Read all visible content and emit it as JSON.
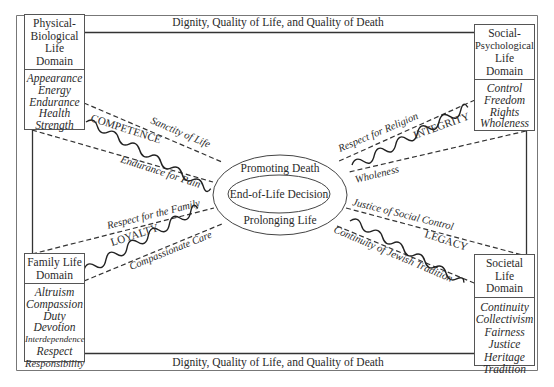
{
  "title_top": "Dignity, Quality of Life, and Quality of Death",
  "title_bottom": "Dignity, Quality of Life, and Quality of Death",
  "center": {
    "outer_top": "Promoting Death",
    "inner": "End-of-Life Decision",
    "outer_bottom": "Prolonging Life"
  },
  "domains": {
    "physical": {
      "head": [
        "Physical-",
        "Biological",
        "Life Domain"
      ],
      "items": [
        "Appearance",
        "Energy",
        "Endurance",
        "Health",
        "Strength"
      ]
    },
    "social": {
      "head": [
        "Social-",
        "Psychological",
        "Life Domain"
      ],
      "items": [
        "Control",
        "Freedom",
        "Rights",
        "Wholeness"
      ]
    },
    "family": {
      "head": [
        "Family Life",
        "Domain"
      ],
      "items": [
        "Altruism",
        "Compassion",
        "Duty",
        "Devotion",
        "Interdependence",
        "Respect",
        "Responsibility"
      ]
    },
    "societal": {
      "head": [
        "Societal Life",
        "Domain"
      ],
      "items": [
        "Continuity",
        "Collectivism",
        "Fairness",
        "Justice",
        "Heritage",
        "Tradition"
      ]
    }
  },
  "bands": {
    "competence": {
      "label": "COMPETENCE",
      "upper": "Sanctity of Life",
      "lower": "Endurance for Pain"
    },
    "integrity": {
      "label": "INTEGRITY",
      "upper": "Respect for Religion",
      "lower": "Wholeness"
    },
    "loyalty": {
      "label": "LOYALTY",
      "upper": "Respect for the Family",
      "lower": "Compassionate Care"
    },
    "legacy": {
      "label": "LEGACY",
      "upper": "Justice of Social Control",
      "lower": "Continuity of Jewish Tradition"
    }
  }
}
